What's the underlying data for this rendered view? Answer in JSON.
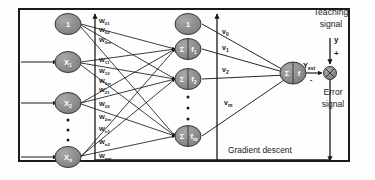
{
  "diagram": {
    "colors": {
      "node_fill": "#8c8c8c",
      "node_stroke": "#3a3a3a",
      "line": "#1a1a1a",
      "frame": "#1a1a1a",
      "text": "#1a1a1a",
      "node_text": "#ffffff",
      "background": "#fefefe"
    },
    "input_layer": {
      "name": "input-layer",
      "nodes": [
        {
          "id": "in-bias",
          "label": "1",
          "sub": ""
        },
        {
          "id": "in-x1",
          "label": "X",
          "sub": "1"
        },
        {
          "id": "in-x2",
          "label": "X",
          "sub": "2"
        },
        {
          "id": "in-xn",
          "label": "X",
          "sub": "n"
        }
      ],
      "ellipsis": "vertical-dots"
    },
    "hidden_layer": {
      "name": "hidden-layer",
      "nodes": [
        {
          "id": "hid-bias",
          "label": "1",
          "sub": "",
          "type": "bias"
        },
        {
          "id": "hid-f1",
          "label": "Σ",
          "fn": "f",
          "sub": "1",
          "type": "neuron"
        },
        {
          "id": "hid-f2",
          "label": "Σ",
          "fn": "f",
          "sub": "2",
          "type": "neuron"
        },
        {
          "id": "hid-fm",
          "label": "Σ",
          "fn": "f",
          "sub": "m",
          "type": "neuron"
        }
      ],
      "ellipsis": "vertical-dots"
    },
    "output_layer": {
      "name": "output-layer",
      "node": {
        "id": "out-f",
        "label": "Σ",
        "fn": "f",
        "sub": "",
        "type": "neuron"
      },
      "output_label": "Y",
      "output_sub": "est"
    },
    "input_weights": {
      "name": "input-to-hidden-weights",
      "items": [
        {
          "sym": "W",
          "sub": "01"
        },
        {
          "sym": "W",
          "sub": "02"
        },
        {
          "sym": "W",
          "sub": "0m"
        },
        {
          "sym": "W",
          "sub": "11"
        },
        {
          "sym": "W",
          "sub": "12"
        },
        {
          "sym": "W",
          "sub": "1m"
        },
        {
          "sym": "W",
          "sub": "21"
        },
        {
          "sym": "W",
          "sub": "22"
        },
        {
          "sym": "W",
          "sub": "2m"
        },
        {
          "sym": "W",
          "sub": "n1"
        },
        {
          "sym": "W",
          "sub": "n2"
        },
        {
          "sym": "W",
          "sub": "nm"
        }
      ]
    },
    "hidden_weights": {
      "name": "hidden-to-output-weights",
      "items": [
        {
          "sym": "v",
          "sub": "0"
        },
        {
          "sym": "v",
          "sub": "1"
        },
        {
          "sym": "v",
          "sub": "2"
        },
        {
          "sym": "v",
          "sub": "m"
        }
      ]
    },
    "annotations": {
      "teaching_signal_line1": "Teaching",
      "teaching_signal_line2": "signal",
      "teaching_input": "y",
      "plus_sign": "+",
      "minus_sign": "-",
      "error_signal_line1": "Error",
      "error_signal_line2": "signal",
      "gradient_descent": "Gradient descent"
    },
    "junction": {
      "name": "summing-junction",
      "symbol": "⊕"
    }
  }
}
